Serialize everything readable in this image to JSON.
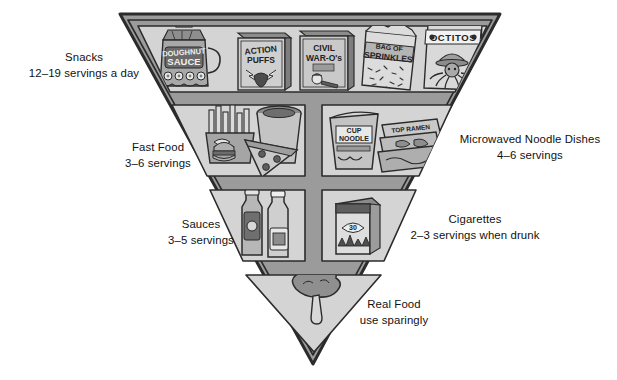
{
  "diagram": {
    "shape": "inverted-triangle",
    "colors": {
      "outline": "#2b2b2b",
      "border_fill": "#9a9a9a",
      "cell_fill": "#d2d2d2",
      "text": "#111111",
      "page_background": "#ffffff",
      "art_dark": "#585858",
      "art_mid": "#8f8f8f",
      "art_light": "#bdbdbd"
    },
    "tiers": [
      {
        "id": "snacks",
        "label": "Snacks",
        "servings": "12–19 servings a day",
        "label_side": "left",
        "items": [
          {
            "name": "doughnut-sauce-jug",
            "package_text": "DOUGHNUT SAUCE"
          },
          {
            "name": "action-puffs-cereal-box",
            "package_text": "ACTION PUFFS"
          },
          {
            "name": "civil-war-os-cereal-box",
            "package_text": "CIVIL WAR-O's"
          },
          {
            "name": "bag-of-sprinkles",
            "package_text": "BAG OF SPRINKLES"
          },
          {
            "name": "octitos-chips-bag",
            "package_text": "OCTITOS"
          }
        ]
      },
      {
        "id": "fast-food",
        "label": "Fast Food",
        "servings": "3–6 servings",
        "label_side": "left",
        "items": [
          {
            "name": "french-fries",
            "package_text": ""
          },
          {
            "name": "soda-cup",
            "package_text": ""
          },
          {
            "name": "pizza-slice",
            "package_text": ""
          },
          {
            "name": "burger",
            "package_text": ""
          }
        ]
      },
      {
        "id": "microwaved-noodle-dishes",
        "label": "Microwaved Noodle Dishes",
        "servings": "4–6 servings",
        "label_side": "right",
        "items": [
          {
            "name": "cup-noodle",
            "package_text": "CUP NOODLE"
          },
          {
            "name": "ramen-packets",
            "package_text": "TOP RAMEN"
          }
        ]
      },
      {
        "id": "sauces",
        "label": "Sauces",
        "servings": "3–5 servings",
        "label_side": "left",
        "items": [
          {
            "name": "mustard-bottle",
            "package_text": ""
          },
          {
            "name": "ketchup-bottle",
            "package_text": ""
          }
        ]
      },
      {
        "id": "cigarettes",
        "label": "Cigarettes",
        "servings": "2–3 servings when drunk",
        "label_side": "right",
        "items": [
          {
            "name": "cigarette-pack",
            "package_text": ""
          }
        ]
      },
      {
        "id": "real-food",
        "label": "Real Food",
        "servings": "use sparingly",
        "label_side": "right",
        "items": [
          {
            "name": "broccoli",
            "package_text": ""
          }
        ]
      }
    ]
  }
}
